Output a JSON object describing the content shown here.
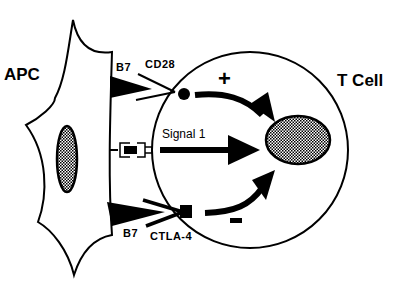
{
  "diagram": {
    "title": "",
    "cells": {
      "apc": {
        "label": "APC"
      },
      "tcell": {
        "label": "T Cell"
      }
    },
    "interactions": [
      {
        "ligand": "B7",
        "receptor": "CD28",
        "effect": "+"
      },
      {
        "ligand": "MHC-peptide",
        "receptor": "TCR",
        "label": "Signal 1"
      },
      {
        "ligand": "B7",
        "receptor": "CTLA-4",
        "effect": "-"
      }
    ],
    "labels": {
      "apc": "APC",
      "tcell": "T Cell",
      "b7_top": "B7",
      "cd28": "CD28",
      "plus": "+",
      "signal1": "Signal 1",
      "b7_bottom": "B7",
      "ctla4": "CTLA-4",
      "minus": "-"
    },
    "colors": {
      "ink": "#000000",
      "background": "#ffffff"
    }
  }
}
